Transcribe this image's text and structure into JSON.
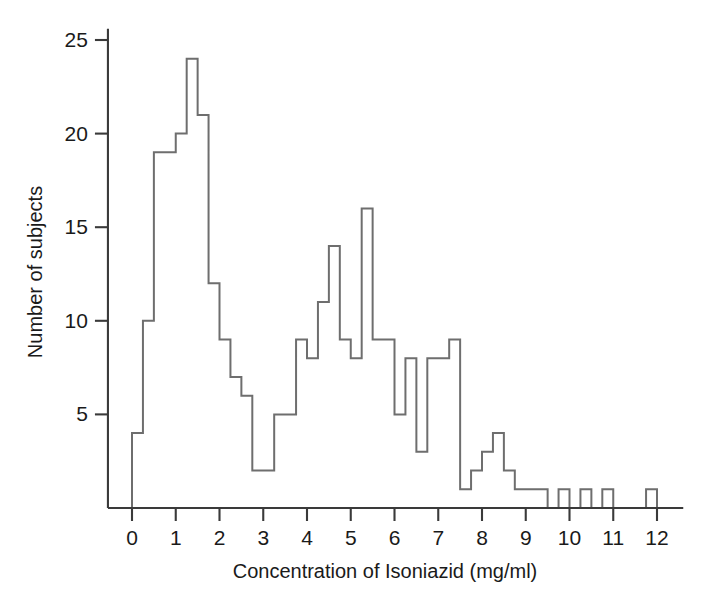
{
  "chart_data": {
    "type": "bar",
    "title": "",
    "xlabel": "Concentration of Isoniazid (mg/ml)",
    "ylabel": "Number of subjects",
    "xlim": [
      -0.55,
      12.6
    ],
    "ylim": [
      0,
      25.6
    ],
    "xticks": [
      0,
      1,
      2,
      3,
      4,
      5,
      6,
      7,
      8,
      9,
      10,
      11,
      12
    ],
    "xtick_labels": [
      "0",
      "1",
      "2",
      "3",
      "4",
      "5",
      "6",
      "7",
      "8",
      "9",
      "10",
      "11",
      "12"
    ],
    "yticks": [
      5,
      10,
      15,
      20,
      25
    ],
    "ytick_labels": [
      "5",
      "10",
      "15",
      "20",
      "25"
    ],
    "grid": false,
    "legend": null,
    "bin_width": 0.25,
    "bin_starts": [
      0.0,
      0.25,
      0.5,
      0.75,
      1.0,
      1.25,
      1.5,
      1.75,
      2.0,
      2.25,
      2.5,
      2.75,
      3.0,
      3.25,
      3.5,
      3.75,
      4.0,
      4.25,
      4.5,
      4.75,
      5.0,
      5.25,
      5.5,
      5.75,
      6.0,
      6.25,
      6.5,
      6.75,
      7.0,
      7.25,
      7.5,
      7.75,
      8.0,
      8.25,
      8.5,
      8.75,
      9.0,
      9.25,
      9.5,
      9.75,
      10.0,
      10.25,
      10.5,
      10.75,
      11.0,
      11.25,
      11.5,
      11.75
    ],
    "values": [
      4,
      10,
      19,
      19,
      20,
      24,
      21,
      12,
      9,
      7,
      6,
      2,
      2,
      5,
      5,
      9,
      8,
      11,
      14,
      9,
      8,
      16,
      9,
      9,
      5,
      8,
      3,
      8,
      8,
      9,
      1,
      2,
      3,
      4,
      2,
      1,
      1,
      1,
      0,
      1,
      0,
      1,
      0,
      1,
      0,
      0,
      0,
      1
    ],
    "categories": [
      "0.00-0.25",
      "0.25-0.50",
      "0.50-0.75",
      "0.75-1.00",
      "1.00-1.25",
      "1.25-1.50",
      "1.50-1.75",
      "1.75-2.00",
      "2.00-2.25",
      "2.25-2.50",
      "2.50-2.75",
      "2.75-3.00",
      "3.00-3.25",
      "3.25-3.50",
      "3.50-3.75",
      "3.75-4.00",
      "4.00-4.25",
      "4.25-4.50",
      "4.50-4.75",
      "4.75-5.00",
      "5.00-5.25",
      "5.25-5.50",
      "5.50-5.75",
      "5.75-6.00",
      "6.00-6.25",
      "6.25-6.50",
      "6.50-6.75",
      "6.75-7.00",
      "7.00-7.25",
      "7.25-7.50",
      "7.50-7.75",
      "7.75-8.00",
      "8.00-8.25",
      "8.25-8.50",
      "8.50-8.75",
      "8.75-9.00",
      "9.00-9.25",
      "9.25-9.50",
      "9.50-9.75",
      "9.75-10.00",
      "10.00-10.25",
      "10.25-10.50",
      "10.50-10.75",
      "10.75-11.00",
      "11.00-11.25",
      "11.25-11.50",
      "11.50-11.75",
      "11.75-12.00"
    ],
    "colors": {
      "line": "#6e6e6e",
      "axis": "#3a3a3a",
      "text": "#1a1a1a",
      "background": "#ffffff"
    }
  }
}
